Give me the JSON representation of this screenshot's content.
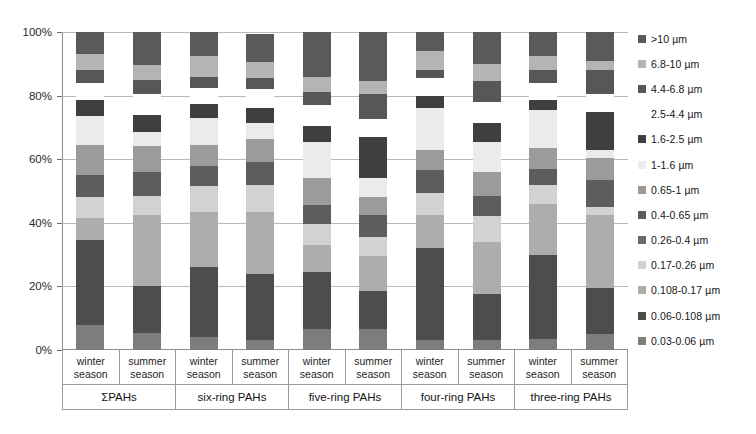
{
  "chart_data": {
    "type": "bar",
    "subtype": "stacked-percentage",
    "title": "",
    "xlabel": "",
    "ylabel": "",
    "ylim": [
      0,
      100
    ],
    "ytick_labels": [
      "0%",
      "20%",
      "40%",
      "60%",
      "80%",
      "100%"
    ],
    "ytick_values": [
      0,
      20,
      40,
      60,
      80,
      100
    ],
    "grid": true,
    "legend_position": "right",
    "legend_title": "",
    "series": [
      {
        "name": "0.03-0.06 µm",
        "color": "#7d7d7d",
        "values": [
          8.0,
          5.5,
          4.0,
          3.0,
          6.5,
          6.5,
          3.0,
          3.0,
          3.5,
          5.0
        ]
      },
      {
        "name": "0.06-0.108 µm",
        "color": "#4d4d4d",
        "values": [
          26.5,
          14.5,
          22.0,
          21.0,
          18.0,
          12.0,
          29.0,
          14.5,
          26.5,
          14.5
        ]
      },
      {
        "name": "0.108-0.17 µm",
        "color": "#adadad",
        "values": [
          7.0,
          22.5,
          17.5,
          19.5,
          8.5,
          11.0,
          10.5,
          16.5,
          16.0,
          23.0
        ]
      },
      {
        "name": "0.17-0.26 µm",
        "color": "#d2d2d2",
        "values": [
          6.5,
          6.0,
          8.0,
          8.5,
          6.5,
          6.0,
          7.0,
          8.0,
          6.0,
          2.5
        ]
      },
      {
        "name": "0.4-0.65 µm",
        "color": "#5d5d5d",
        "values": [
          7.0,
          7.5,
          6.5,
          7.0,
          6.0,
          7.0,
          7.0,
          6.5,
          5.0,
          8.5
        ]
      },
      {
        "name": "0.65-1 µm",
        "color": "#9b9b9b",
        "values": [
          9.5,
          8.0,
          6.5,
          7.5,
          8.5,
          5.5,
          6.5,
          7.5,
          6.5,
          7.0
        ]
      },
      {
        "name": "1-1.6 µm",
        "color": "#ebebeb",
        "values": [
          9.0,
          4.5,
          8.5,
          5.0,
          11.5,
          6.0,
          13.0,
          9.5,
          12.0,
          2.5
        ]
      },
      {
        "name": "1.6-2.5 µm",
        "color": "#3f3f3f",
        "values": [
          5.0,
          5.5,
          4.5,
          4.5,
          5.0,
          13.0,
          4.0,
          6.0,
          3.0,
          12.0
        ]
      },
      {
        "name": "2.5-4.4 µm",
        "color": "#ffffff",
        "values": [
          5.5,
          6.5,
          5.0,
          6.0,
          6.5,
          5.5,
          5.5,
          6.5,
          5.5,
          5.5
        ]
      },
      {
        "name": "4.4-6.8 µm",
        "color": "#575757",
        "values": [
          4.0,
          4.5,
          3.5,
          3.5,
          4.0,
          8.0,
          2.5,
          6.5,
          4.0,
          7.5
        ]
      },
      {
        "name": "6.8-10 µm",
        "color": "#b4b4b4",
        "values": [
          5.0,
          4.5,
          6.5,
          5.0,
          5.0,
          4.0,
          6.0,
          5.5,
          4.5,
          3.0
        ]
      },
      {
        "name": ">10 µm",
        "color": "#5a5a5a",
        "values": [
          7.0,
          10.5,
          7.5,
          9.0,
          14.0,
          15.5,
          6.0,
          10.0,
          7.5,
          9.0
        ]
      }
    ],
    "categories": [
      "winter season",
      "summer season",
      "winter season",
      "summer season",
      "winter season",
      "summer season",
      "winter season",
      "summer season",
      "winter season",
      "summer season"
    ],
    "groups": [
      "ΣPAHs",
      "six-ring PAHs",
      "five-ring PAHs",
      "four-ring PAHs",
      "three-ring PAHs"
    ]
  },
  "legend": {
    "items": [
      {
        "label": ">10 µm",
        "color": "#5a5a5a"
      },
      {
        "label": "6.8-10 µm",
        "color": "#b4b4b4"
      },
      {
        "label": "4.4-6.8 µm",
        "color": "#575757"
      },
      {
        "label": "2.5-4.4 µm",
        "color": "#ffffff"
      },
      {
        "label": "1.6-2.5 µm",
        "color": "#3f3f3f"
      },
      {
        "label": "1-1.6 µm",
        "color": "#ebebeb"
      },
      {
        "label": "0.65-1 µm",
        "color": "#9b9b9b"
      },
      {
        "label": "0.4-0.65 µm",
        "color": "#5d5d5d"
      },
      {
        "label": "0.26-0.4 µm",
        "color": "#6b6b6b"
      },
      {
        "label": "0.17-0.26 µm",
        "color": "#d2d2d2"
      },
      {
        "label": "0.108-0.17 µm",
        "color": "#adadad"
      },
      {
        "label": "0.06-0.108 µm",
        "color": "#4d4d4d"
      },
      {
        "label": "0.03-0.06 µm",
        "color": "#7d7d7d"
      }
    ]
  },
  "axis": {
    "y_ticks": [
      "100%",
      "80%",
      "60%",
      "40%",
      "20%",
      "0%"
    ]
  },
  "xaxis": {
    "season_labels": [
      "winter\nseason",
      "summer\nseason",
      "winter\nseason",
      "summer\nseason",
      "winter\nseason",
      "summer\nseason",
      "winter\nseason",
      "summer\nseason",
      "winter\nseason",
      "summer\nseason"
    ],
    "group_labels": [
      "ΣPAHs",
      "six-ring PAHs",
      "five-ring PAHs",
      "four-ring PAHs",
      "three-ring PAHs"
    ]
  }
}
